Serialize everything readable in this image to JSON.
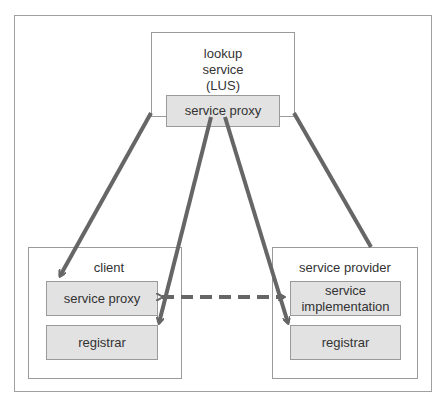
{
  "diagram": {
    "lus": {
      "title_line1": "lookup",
      "title_line2": "service",
      "title_line3": "(LUS)",
      "proxy": "service proxy"
    },
    "client": {
      "title": "client",
      "proxy": "service proxy",
      "registrar": "registrar"
    },
    "provider": {
      "title": "service provider",
      "impl_line1": "service",
      "impl_line2": "implementation",
      "registrar": "registrar"
    },
    "colors": {
      "line": "#666666",
      "box_fill": "#e2e2e2",
      "border": "#9a9a9a"
    }
  }
}
